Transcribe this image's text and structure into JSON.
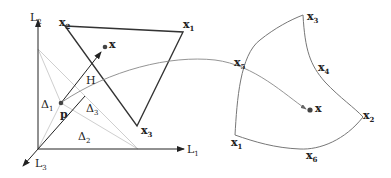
{
  "left_panel": {
    "axes": {
      "L1": "L",
      "L1_sub": "1",
      "L2": "L",
      "L2_sub": "2",
      "L3": "L",
      "L3_sub": "3"
    },
    "triangle_vertices": [
      {
        "name": "x",
        "sub": "1"
      },
      {
        "name": "x",
        "sub": "2"
      },
      {
        "name": "x",
        "sub": "3"
      }
    ],
    "regions": [
      {
        "name": "Δ",
        "sub": "1"
      },
      {
        "name": "Δ",
        "sub": "2"
      },
      {
        "name": "Δ",
        "sub": "3"
      }
    ],
    "point_p": "p",
    "point_x": "x",
    "hyperplane": "H"
  },
  "right_panel": {
    "vertices": [
      {
        "name": "x",
        "sub": "1"
      },
      {
        "name": "x",
        "sub": "2"
      },
      {
        "name": "x",
        "sub": "3"
      },
      {
        "name": "x",
        "sub": "4"
      },
      {
        "name": "x",
        "sub": "5"
      },
      {
        "name": "x",
        "sub": "6"
      }
    ],
    "point_x": "x"
  },
  "colors": {
    "dark": "#333333",
    "light": "#c8c8c8",
    "mid": "#888888"
  }
}
